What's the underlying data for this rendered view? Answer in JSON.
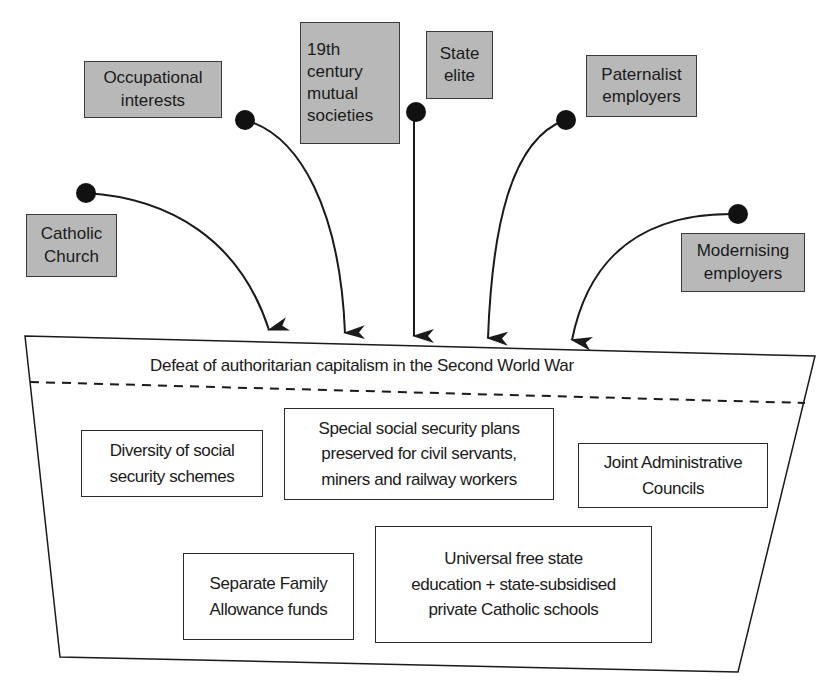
{
  "diagram": {
    "type": "influence-funnel",
    "colors": {
      "source_box_fill": "#b8b8b8",
      "line": "#1a1a1a",
      "background": "#ffffff"
    },
    "sources": [
      {
        "id": "catholic-church",
        "label": "Catholic\nChurch"
      },
      {
        "id": "occupational-interests",
        "label": "Occupational\ninterests"
      },
      {
        "id": "mutual-societies",
        "label": "19th\ncentury\nmutual\nsocieties"
      },
      {
        "id": "state-elite",
        "label": "State\nelite"
      },
      {
        "id": "paternalist-employers",
        "label": "Paternalist\nemployers"
      },
      {
        "id": "modernising-employers",
        "label": "Modernising\nemployers"
      }
    ],
    "funnel": {
      "header": "Defeat of authoritarian capitalism in the Second World War",
      "outcomes": [
        {
          "id": "diversity",
          "label": "Diversity of social\nsecurity schemes"
        },
        {
          "id": "special-plans",
          "label": "Special social security plans\npreserved for civil servants,\nminers and railway workers"
        },
        {
          "id": "joint-councils",
          "label": "Joint Administrative\nCouncils"
        },
        {
          "id": "family-allowance",
          "label": "Separate Family\nAllowance funds"
        },
        {
          "id": "education",
          "label": "Universal free state\neducation + state-subsidised\nprivate Catholic schools"
        }
      ]
    }
  }
}
